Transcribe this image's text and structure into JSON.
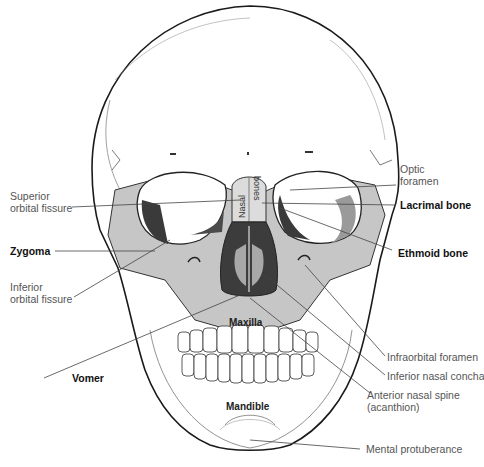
{
  "figure": {
    "colors": {
      "bone_white": "#ffffff",
      "bone_shaded": "#c8c8c8",
      "highlight_region": "#b5b5b5",
      "dark_cavity": "#3a3a3a",
      "outline": "#1a1a1a",
      "leader_line": "#444444",
      "label_text": "#555555",
      "bold_label_text": "#111111"
    }
  },
  "labels_left": [
    {
      "id": "superior-orbital-fissure",
      "line1": "Superior",
      "line2": "orbital fissure",
      "bold": false
    },
    {
      "id": "zygoma",
      "line1": "Zygoma",
      "line2": "",
      "bold": true
    },
    {
      "id": "inferior-orbital-fissure",
      "line1": "Inferior",
      "line2": "orbital fissure",
      "bold": false
    },
    {
      "id": "vomer",
      "line1": "Vomer",
      "line2": "",
      "bold": true
    }
  ],
  "labels_right": [
    {
      "id": "optic-foramen",
      "line1": "Optic",
      "line2": "foramen",
      "bold": false
    },
    {
      "id": "lacrimal-bone",
      "line1": "Lacrimal bone",
      "line2": "",
      "bold": true
    },
    {
      "id": "ethmoid-bone",
      "line1": "Ethmoid bone",
      "line2": "",
      "bold": true
    },
    {
      "id": "infraorbital-foramen",
      "line1": "Infraorbital foramen",
      "line2": "",
      "bold": false
    },
    {
      "id": "inferior-nasal-concha",
      "line1": "Inferior nasal concha",
      "line2": "",
      "bold": false
    },
    {
      "id": "anterior-nasal-spine",
      "line1": "Anterior nasal spine",
      "line2": "(acanthion)",
      "bold": false
    },
    {
      "id": "mental-protuberance",
      "line1": "Mental protuberance",
      "line2": "",
      "bold": false
    }
  ],
  "labels_inner": [
    {
      "id": "nasal-bones",
      "line1": "Nasal",
      "line2": "bones"
    },
    {
      "id": "maxilla",
      "line1": "Maxilla"
    },
    {
      "id": "mandible",
      "line1": "Mandible"
    }
  ]
}
